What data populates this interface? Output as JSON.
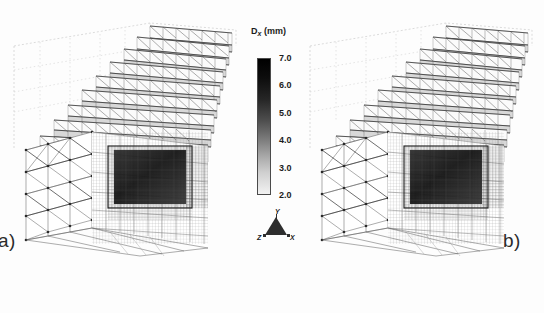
{
  "figure": {
    "background_color": "#fdfdfd",
    "panels": [
      {
        "id": "a",
        "caption": "a)",
        "description": "3D finite-element mesh block with stepped upper surface, unstructured triangular mesh on left face, structured quadrilateral grid on right face, and dense refined dark rectangular region on front face"
      },
      {
        "id": "b",
        "caption": "b)",
        "description": "3D finite-element mesh block with stepped upper surface, unstructured triangular mesh on left face, structured quadrilateral grid on right face, and dense refined dark rectangular region on front face"
      }
    ]
  },
  "legend": {
    "title_main": "D",
    "title_subscript": "x",
    "title_units": " (mm)",
    "colorbar": {
      "orientation": "vertical",
      "colormap": "grayscale",
      "high_color": "#000000",
      "low_color": "#f2f2f2",
      "min": 2.0,
      "max": 7.0,
      "ticks": [
        "7.0",
        "6.0",
        "5.0",
        "4.0",
        "3.0",
        "2.0"
      ]
    },
    "axis_triad": {
      "up_label": "Y",
      "left_label": "Z",
      "right_label": "X",
      "marker_color": "#2e2e2e"
    }
  },
  "chart_data": {
    "type": "heatmap",
    "title": "",
    "xlabel": "",
    "ylabel": "",
    "colorbar_label": "Dx (mm)",
    "colorbar_ticks": [
      7.0,
      6.0,
      5.0,
      4.0,
      3.0,
      2.0
    ],
    "colorbar_range": [
      2.0,
      7.0
    ],
    "colormap": "grayscale",
    "legend_position": "center",
    "grid": false,
    "panels": [
      {
        "label": "a)",
        "mesh_type": "hybrid tetrahedral/hexahedral",
        "refined_zone": "central rectangular patch"
      },
      {
        "label": "b)",
        "mesh_type": "hybrid tetrahedral/hexahedral",
        "refined_zone": "central rectangular patch"
      }
    ]
  }
}
